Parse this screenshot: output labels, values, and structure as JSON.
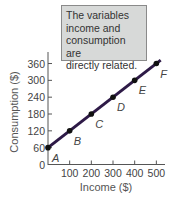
{
  "callout": {
    "lines": [
      "The variables",
      "income and",
      "consumption are",
      "directly related."
    ]
  },
  "chart_data": {
    "type": "line",
    "title": "",
    "xlabel": "Income ($)",
    "ylabel": "Consumption ($)",
    "xlim": [
      0,
      520
    ],
    "ylim": [
      0,
      380
    ],
    "x_ticks": [
      100,
      200,
      300,
      400,
      500
    ],
    "y_ticks": [
      0,
      60,
      120,
      180,
      240,
      300,
      360
    ],
    "series": [
      {
        "name": "Consumption",
        "color": "#2e1a47",
        "points": [
          {
            "label": "A",
            "x": 0,
            "y": 60
          },
          {
            "label": "B",
            "x": 100,
            "y": 120
          },
          {
            "label": "C",
            "x": 200,
            "y": 180
          },
          {
            "label": "D",
            "x": 300,
            "y": 240
          },
          {
            "label": "E",
            "x": 400,
            "y": 300
          },
          {
            "label": "F",
            "x": 500,
            "y": 360
          }
        ]
      }
    ],
    "annotation": "The variables income and consumption are directly related.",
    "grid": false
  }
}
